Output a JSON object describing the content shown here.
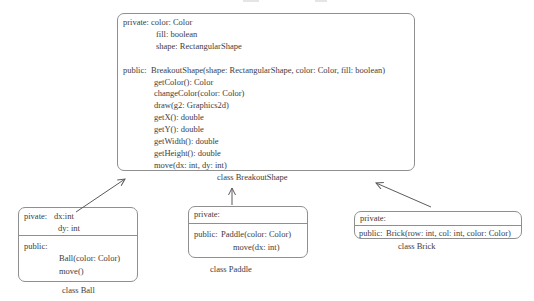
{
  "diagram": {
    "colors": {
      "background": "#ffffff",
      "border": "#8f8f8f",
      "text": "#3d3d3d",
      "arrow": "#5a5a5a"
    },
    "breakout_shape": {
      "caption": "class BreakoutShape",
      "private_label": "private:",
      "public_label": "public:",
      "fields": [
        "color: Color",
        "fill: boolean",
        "shape: RectangularShape"
      ],
      "methods": [
        "BreakoutShape(shape: RectangularShape, color: Color, fill: boolean)",
        "getColor(): Color",
        "changeColor(color: Color)",
        "draw(g2: Graphics2d)",
        "getX(): double",
        "getY(): double",
        "getWidth(): double",
        "getHeight(): double",
        "move(dx: int, dy: int)"
      ]
    },
    "ball": {
      "caption": "class Ball",
      "private_label": "pivate:",
      "public_label": "public:",
      "fields": [
        "dx:int",
        "dy: int"
      ],
      "methods": [
        "Ball(color: Color)",
        "move()"
      ]
    },
    "paddle": {
      "caption": "class Paddle",
      "private_label": "private:",
      "public_label": "public:",
      "fields": [],
      "methods": [
        "Paddle(color: Color)",
        "move(dx: int)"
      ]
    },
    "brick": {
      "caption": "class Brick",
      "private_label": "private:",
      "public_label": "public:",
      "fields": [],
      "methods": [
        "Brick(row: int, col: int, color: Color)"
      ]
    }
  }
}
